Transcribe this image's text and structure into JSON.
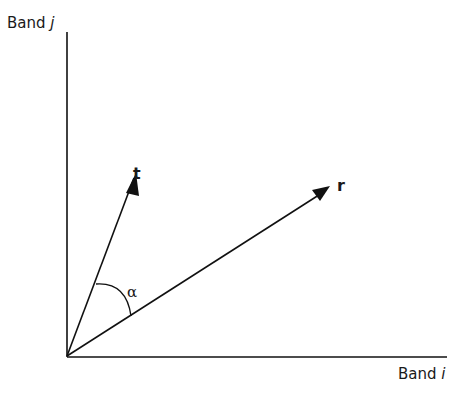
{
  "diagram": {
    "y_axis_label": {
      "text": "Band",
      "var": "j"
    },
    "x_axis_label": {
      "text": "Band",
      "var": "i"
    },
    "vectors": [
      {
        "name": "t",
        "label": "t"
      },
      {
        "name": "r",
        "label": "r"
      }
    ],
    "angle_label": "α",
    "line_color": "#111111"
  }
}
